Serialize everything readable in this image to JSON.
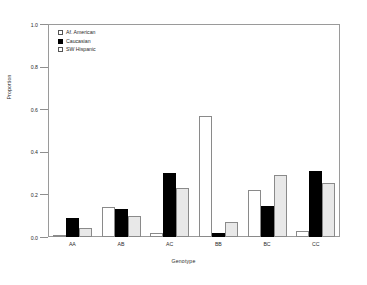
{
  "chart_data": {
    "type": "bar",
    "title": "",
    "xlabel": "Genotype",
    "ylabel": "Proportion",
    "categories": [
      "AA",
      "AB",
      "AC",
      "BB",
      "BC",
      "CC"
    ],
    "series": [
      {
        "name": "Af. American",
        "style": "open",
        "color": "#ffffff",
        "values": [
          0.01,
          0.14,
          0.02,
          0.57,
          0.22,
          0.03
        ]
      },
      {
        "name": "Caucasian",
        "style": "solid",
        "color": "#000000",
        "values": [
          0.09,
          0.13,
          0.3,
          0.02,
          0.145,
          0.31
        ]
      },
      {
        "name": "SW Hispanic",
        "style": "grey",
        "color": "#e8e8e8",
        "values": [
          0.04,
          0.1,
          0.23,
          0.07,
          0.29,
          0.255
        ]
      }
    ],
    "ylim": [
      0.0,
      1.0
    ],
    "yticks": [
      "0.0",
      "0.2",
      "0.4",
      "0.6",
      "0.8",
      "1.0"
    ],
    "ytick_values": [
      0.0,
      0.2,
      0.4,
      0.6,
      0.8,
      1.0
    ],
    "grid": false,
    "legend_position": "top-left"
  }
}
